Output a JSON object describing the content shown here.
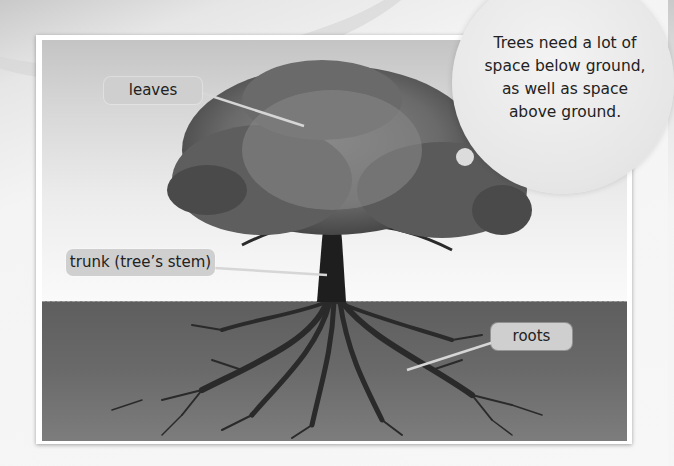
{
  "diagram": {
    "labels": {
      "leaves": "leaves",
      "trunk": "trunk (tree’s stem)",
      "roots": "roots"
    },
    "callout": {
      "lines": [
        "Trees need a lot of",
        "space below ground,",
        "as well as space",
        "above ground."
      ]
    },
    "colors": {
      "label_bg": "#cfcfcf",
      "ground": "#666666",
      "sky_top": "#c4c4c4",
      "trunk": "#1e1e1e",
      "foliage": "#6e6e6e"
    }
  }
}
